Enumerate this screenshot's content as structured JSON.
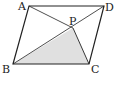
{
  "diagram": {
    "type": "geometry",
    "points": {
      "A": {
        "label": "A",
        "x": 29,
        "y": 6
      },
      "B": {
        "label": "B",
        "x": 13,
        "y": 64
      },
      "C": {
        "label": "C",
        "x": 89,
        "y": 64
      },
      "D": {
        "label": "D",
        "x": 104,
        "y": 6
      },
      "P": {
        "label": "P",
        "x": 73,
        "y": 28
      }
    },
    "segments": [
      "AB",
      "BC",
      "CD",
      "DA",
      "BD",
      "AP",
      "PC"
    ],
    "shaded_region": "BPC",
    "colors": {
      "stroke": "#222222",
      "shade": "#e0e0e0",
      "background": "#ffffff"
    }
  }
}
